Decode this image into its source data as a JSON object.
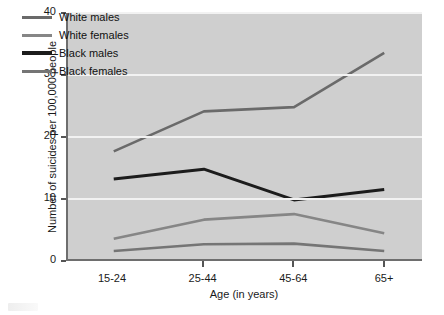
{
  "chart_data": {
    "type": "line",
    "title": "",
    "xlabel": "Age (in years)",
    "ylabel": "Number of suicides per 100,000 people",
    "categories": [
      "15-24",
      "25-44",
      "45-64",
      "65+"
    ],
    "ylim": [
      0,
      40
    ],
    "yticks": [
      0,
      10,
      20,
      30,
      40
    ],
    "ytick_labels": [
      "0",
      "10",
      "20",
      "30",
      "40"
    ],
    "grid": "horizontal",
    "legend_position": "top-left-inside",
    "series": [
      {
        "name": "White males",
        "values": [
          17.5,
          24.0,
          24.7,
          33.5
        ],
        "color": "#6a6a6a"
      },
      {
        "name": "White females",
        "values": [
          3.3,
          6.4,
          7.3,
          4.2
        ],
        "color": "#868686"
      },
      {
        "name": "Black males",
        "values": [
          13.0,
          14.6,
          9.6,
          11.3
        ],
        "color": "#1c1c1c"
      },
      {
        "name": "Black females",
        "values": [
          1.3,
          2.4,
          2.5,
          1.3
        ],
        "color": "#757575"
      }
    ]
  },
  "axes": {
    "y_title": "Number of suicides per 100,000 people",
    "x_title": "Age (in years)",
    "y_ticks": [
      "0",
      "10",
      "20",
      "30",
      "40"
    ],
    "x_ticks": [
      "15-24",
      "25-44",
      "45-64",
      "65+"
    ]
  },
  "legend": {
    "items": [
      {
        "label": "White males"
      },
      {
        "label": "White females"
      },
      {
        "label": "Black males"
      },
      {
        "label": "Black females"
      }
    ]
  },
  "colors": {
    "plot_background": "#cfcfcf",
    "page_background": "#ffffff",
    "gridline": "#f2f2f2",
    "axis": "#6e6e6e",
    "text": "#1a1a1a"
  }
}
